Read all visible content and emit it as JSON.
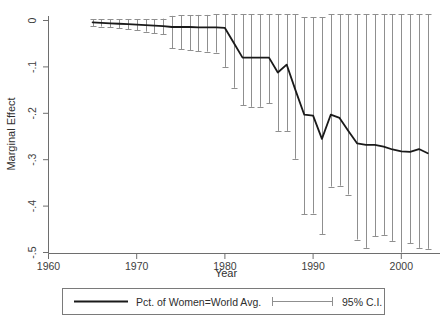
{
  "chart_data": {
    "type": "line",
    "title": "",
    "subtitle": "",
    "xlabel": "Year",
    "ylabel": "Marginal Effect",
    "xlim": [
      1960,
      2004.5
    ],
    "ylim": [
      -0.5,
      0.0
    ],
    "xticks": [
      1960,
      1970,
      1980,
      1990,
      2000
    ],
    "xticklabels": [
      "1960",
      "1970",
      "1980",
      "1990",
      "2000"
    ],
    "yticks": [
      0,
      -0.1,
      -0.2,
      -0.3,
      -0.4,
      -0.5
    ],
    "yticklabels": [
      "0",
      "-.1",
      "-.2",
      "-.3",
      "-.4",
      "-.5"
    ],
    "grid": false,
    "legend_position": "bottom",
    "series": [
      {
        "name": "Pct. of Women=World Avg.",
        "kind": "line",
        "color": "#1a1a1a",
        "x": [
          1965,
          1966,
          1967,
          1968,
          1969,
          1970,
          1971,
          1972,
          1973,
          1974,
          1975,
          1976,
          1977,
          1978,
          1979,
          1980,
          1981,
          1982,
          1983,
          1984,
          1985,
          1986,
          1987,
          1988,
          1989,
          1990,
          1991,
          1992,
          1993,
          1994,
          1995,
          1996,
          1997,
          1998,
          1999,
          2000,
          2001,
          2002,
          2003
        ],
        "y": [
          -0.004,
          -0.005,
          -0.006,
          -0.007,
          -0.008,
          -0.009,
          -0.01,
          -0.011,
          -0.012,
          -0.014,
          -0.014,
          -0.014,
          -0.015,
          -0.015,
          -0.015,
          -0.016,
          -0.048,
          -0.08,
          -0.08,
          -0.08,
          -0.08,
          -0.112,
          -0.095,
          -0.15,
          -0.203,
          -0.205,
          -0.255,
          -0.203,
          -0.21,
          -0.238,
          -0.265,
          -0.268,
          -0.268,
          -0.272,
          -0.278,
          -0.282,
          -0.283,
          -0.277,
          -0.286
        ]
      },
      {
        "name": "95% C.I.",
        "kind": "errorbar",
        "color": "#8f8f8f",
        "x": [
          1965,
          1966,
          1967,
          1968,
          1969,
          1970,
          1971,
          1972,
          1973,
          1974,
          1975,
          1976,
          1977,
          1978,
          1979,
          1980,
          1981,
          1982,
          1983,
          1984,
          1985,
          1986,
          1987,
          1988,
          1989,
          1990,
          1991,
          1992,
          1993,
          1994,
          1995,
          1996,
          1997,
          1998,
          1999,
          2000,
          2001,
          2002,
          2003
        ],
        "lower": [
          -0.012,
          -0.013,
          -0.015,
          -0.017,
          -0.019,
          -0.021,
          -0.024,
          -0.027,
          -0.03,
          -0.06,
          -0.062,
          -0.064,
          -0.066,
          -0.067,
          -0.069,
          -0.1,
          -0.145,
          -0.183,
          -0.186,
          -0.186,
          -0.178,
          -0.238,
          -0.238,
          -0.298,
          -0.418,
          -0.416,
          -0.46,
          -0.358,
          -0.356,
          -0.375,
          -0.472,
          -0.49,
          -0.465,
          -0.462,
          -0.475,
          -0.5,
          -0.48,
          -0.49,
          -0.492
        ],
        "upper": [
          0.003,
          0.003,
          0.003,
          0.003,
          0.003,
          0.003,
          0.003,
          0.003,
          0.004,
          0.01,
          0.011,
          0.011,
          0.012,
          0.012,
          0.013,
          0.013,
          0.013,
          0.013,
          0.013,
          0.014,
          0.014,
          0.013,
          0.013,
          0.013,
          0.007,
          0.007,
          0.007,
          0.013,
          0.013,
          0.013,
          0.013,
          0.013,
          0.014,
          0.014,
          0.014,
          0.013,
          0.013,
          0.013,
          0.013
        ]
      }
    ]
  },
  "legend": {
    "items": [
      {
        "label": "Pct. of Women=World Avg.",
        "marker": "line"
      },
      {
        "label": "95% C.I.",
        "marker": "errorbar"
      }
    ]
  },
  "axes": {
    "x_title": "Year",
    "y_title": "Marginal Effect"
  }
}
